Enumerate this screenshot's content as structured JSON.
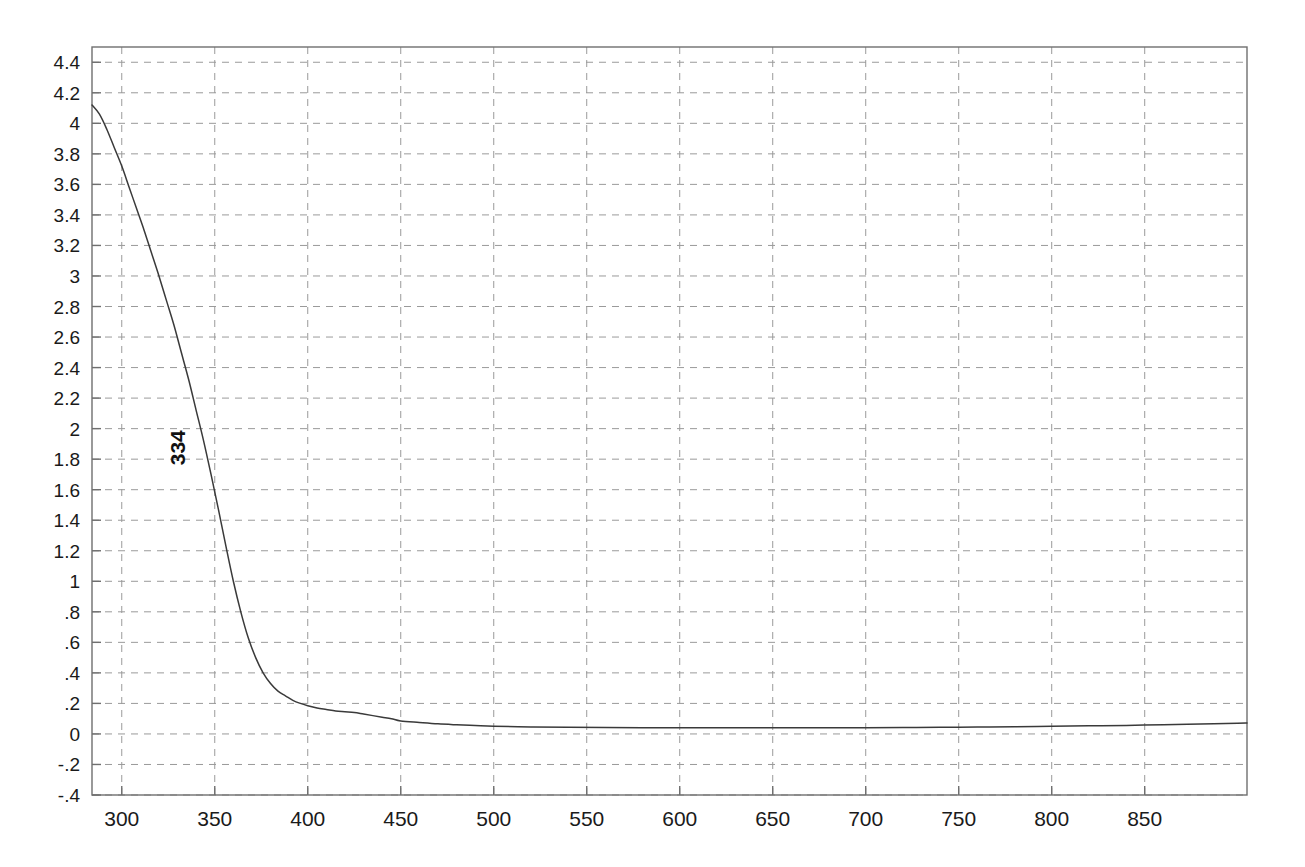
{
  "chart_data": {
    "type": "line",
    "title": "",
    "subtitle": "",
    "xlabel": "",
    "ylabel": "",
    "xlim": [
      284,
      905
    ],
    "ylim": [
      -0.4,
      4.5
    ],
    "grid": true,
    "legend": null,
    "x_ticks": [
      300,
      350,
      400,
      450,
      500,
      550,
      600,
      650,
      700,
      750,
      800,
      850
    ],
    "x_tick_labels": [
      "300",
      "350",
      "400",
      "450",
      "500",
      "550",
      "600",
      "650",
      "700",
      "750",
      "800",
      "850"
    ],
    "y_ticks": [
      -0.4,
      -0.2,
      0,
      0.2,
      0.4,
      0.6,
      0.8,
      1,
      1.2,
      1.4,
      1.6,
      1.8,
      2,
      2.2,
      2.4,
      2.6,
      2.8,
      3,
      3.2,
      3.4,
      3.6,
      3.8,
      4,
      4.2,
      4.4
    ],
    "y_tick_labels": [
      "-.4",
      "-.2",
      "0",
      ".2",
      ".4",
      ".6",
      ".8",
      "1",
      "1.2",
      "1.4",
      "1.6",
      "1.8",
      "2",
      "2.2",
      "2.4",
      "2.6",
      "2.8",
      "3",
      "3.2",
      "3.4",
      "3.6",
      "3.8",
      "4",
      "4.2",
      "4.4"
    ],
    "annotations": [
      {
        "label": "334",
        "x": 334,
        "y": 1.76,
        "rotation": -90
      }
    ],
    "series": [
      {
        "name": "absorbance",
        "color": "#3a3a3a",
        "x": [
          284,
          288,
          292,
          296,
          300,
          304,
          308,
          312,
          316,
          320,
          324,
          328,
          332,
          336,
          340,
          344,
          348,
          352,
          356,
          360,
          364,
          368,
          372,
          376,
          380,
          384,
          388,
          392,
          396,
          400,
          405,
          410,
          415,
          420,
          425,
          430,
          435,
          440,
          445,
          450,
          460,
          470,
          480,
          490,
          500,
          520,
          540,
          560,
          580,
          600,
          620,
          640,
          660,
          680,
          700,
          720,
          740,
          760,
          780,
          800,
          820,
          840,
          860,
          880,
          900,
          905
        ],
        "y": [
          4.12,
          4.06,
          3.96,
          3.84,
          3.72,
          3.58,
          3.44,
          3.3,
          3.15,
          3.0,
          2.84,
          2.68,
          2.5,
          2.32,
          2.12,
          1.92,
          1.7,
          1.47,
          1.23,
          1.0,
          0.8,
          0.63,
          0.5,
          0.4,
          0.33,
          0.28,
          0.25,
          0.22,
          0.2,
          0.185,
          0.17,
          0.16,
          0.15,
          0.145,
          0.14,
          0.13,
          0.12,
          0.11,
          0.1,
          0.085,
          0.075,
          0.066,
          0.06,
          0.055,
          0.05,
          0.046,
          0.043,
          0.042,
          0.041,
          0.04,
          0.04,
          0.04,
          0.04,
          0.04,
          0.041,
          0.042,
          0.043,
          0.045,
          0.047,
          0.05,
          0.053,
          0.056,
          0.06,
          0.065,
          0.07,
          0.072
        ]
      }
    ]
  },
  "plot_geometry": {
    "left": 92,
    "right": 1247,
    "top": 47,
    "bottom": 795
  },
  "colors": {
    "curve": "#3a3a3a",
    "grid": "#9a9a9a",
    "frame": "#6f6f6f",
    "text": "#1a1a1a",
    "background": "#ffffff"
  }
}
